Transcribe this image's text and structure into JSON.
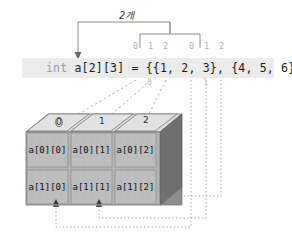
{
  "diagram": {
    "title_label": "2개",
    "code": {
      "keyword": "int",
      "rest": " a[2][3] = {{1, 2, 3}, {4, 5, 6}};",
      "full": "int a[2][3] = {{1, 2, 3}, {4, 5, 6}};"
    },
    "element_index_labels": [
      {
        "text": "0",
        "x": 135,
        "y": 45
      },
      {
        "text": "1",
        "x": 149,
        "y": 45
      },
      {
        "text": "2",
        "x": 164,
        "y": 45
      },
      {
        "text": "0",
        "x": 190,
        "y": 45
      },
      {
        "text": "1",
        "x": 205,
        "y": 45
      },
      {
        "text": "2",
        "x": 220,
        "y": 45
      }
    ],
    "row_index_labels": [
      {
        "text": "0",
        "x": 148,
        "y": 78
      },
      {
        "text": "1",
        "x": 204,
        "y": 78
      }
    ],
    "cube": {
      "top_numbers": [
        {
          "text": "0",
          "x": 56,
          "y": 120
        },
        {
          "text": "1",
          "x": 98,
          "y": 118
        },
        {
          "text": "2",
          "x": 140,
          "y": 116
        }
      ],
      "rows": [
        {
          "row_index": 0,
          "cells": [
            {
              "text": "a[0][0]",
              "x": 29,
              "y": 155
            },
            {
              "text": "a[0][1]",
              "x": 72,
              "y": 155
            },
            {
              "text": "a[0][2]",
              "x": 115,
              "y": 155
            }
          ]
        },
        {
          "row_index": 1,
          "cells": [
            {
              "text": "a[1][0]",
              "x": 29,
              "y": 190
            },
            {
              "text": "a[1][1]",
              "x": 72,
              "y": 190
            },
            {
              "text": "a[1][2]",
              "x": 115,
              "y": 190
            }
          ]
        }
      ]
    },
    "colors": {
      "code_band": "#ebebeb",
      "code_keyword": "#9a9a9a",
      "code_text": "#1c1c1c",
      "index_digit": "#b0b0b0",
      "cube_front": "#b9b9b9",
      "cube_top": "#dcdcdc",
      "cube_side": "#6f6f6f",
      "cube_edge": "#6d6d6d",
      "leader_line": "#9c9c9c",
      "bracket_line": "#8c8c8c"
    }
  }
}
